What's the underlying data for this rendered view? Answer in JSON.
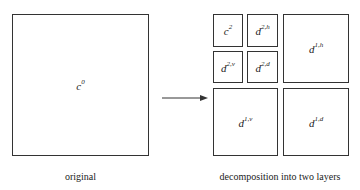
{
  "original": {
    "label_base": "c",
    "label_sup": "0",
    "caption": "original"
  },
  "decomposition": {
    "caption": "decomposition into two layers",
    "blocks": [
      {
        "base": "c",
        "sup": "2"
      },
      {
        "base": "d",
        "sup": "2,h"
      },
      {
        "base": "d",
        "sup": "2,v"
      },
      {
        "base": "d",
        "sup": "2,d"
      },
      {
        "base": "d",
        "sup": "1,h"
      },
      {
        "base": "d",
        "sup": "1,v"
      },
      {
        "base": "d",
        "sup": "1,d"
      }
    ]
  },
  "arrow": {
    "direction": "right"
  }
}
